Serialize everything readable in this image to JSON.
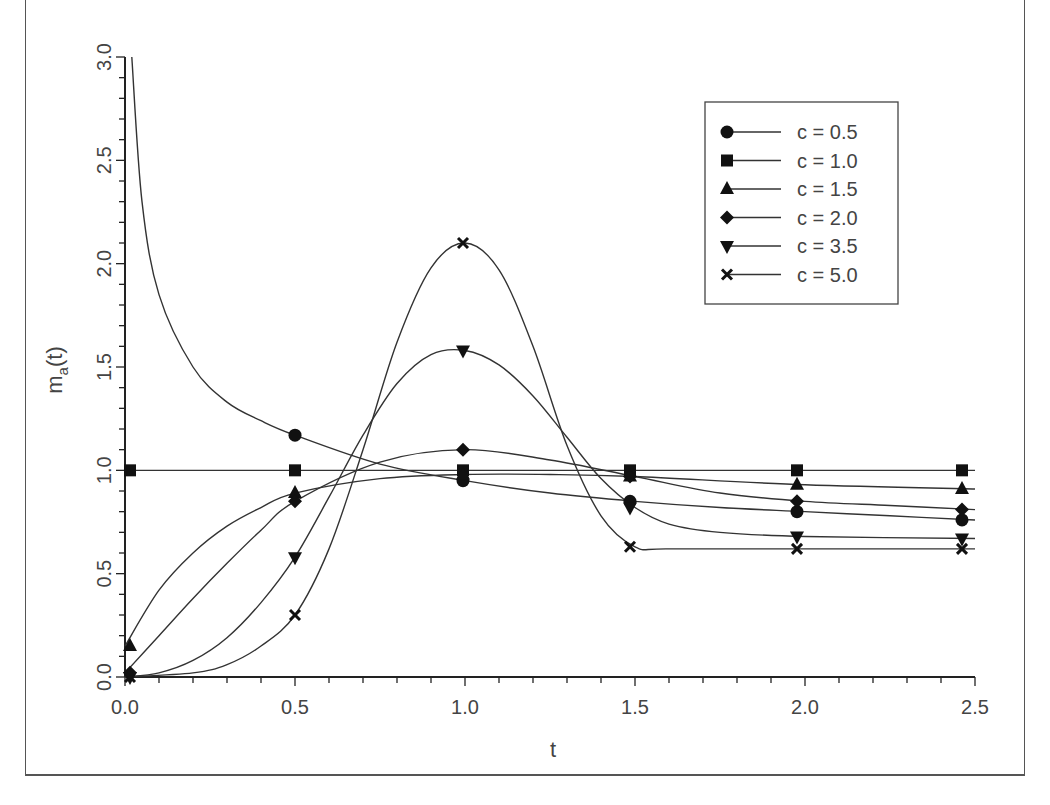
{
  "chart_data": {
    "type": "line",
    "title": "",
    "xlabel": "t",
    "ylabel": "m_a(t)",
    "ylabel_main": "m",
    "ylabel_sub": "a",
    "ylabel_tail": "(t)",
    "xlim": [
      0.0,
      2.5
    ],
    "ylim": [
      0.0,
      3.0
    ],
    "grid": false,
    "legend_position": "upper right",
    "x_ticks": [
      "0.0",
      "0.5",
      "1.0",
      "1.5",
      "2.0",
      "2.5"
    ],
    "y_ticks": [
      "0.0",
      "0.5",
      "1.0",
      "1.5",
      "2.0",
      "2.5",
      "3.0"
    ],
    "x": [
      0.0,
      0.5,
      1.0,
      1.5,
      2.0,
      2.5
    ],
    "series": [
      {
        "name": "c = 0.5",
        "marker": "circle",
        "values": [
          null,
          1.17,
          0.95,
          0.85,
          0.8,
          0.76
        ],
        "curve": [
          [
            0.02,
            3.0
          ],
          [
            0.05,
            2.3
          ],
          [
            0.1,
            1.85
          ],
          [
            0.2,
            1.5
          ],
          [
            0.3,
            1.33
          ],
          [
            0.4,
            1.24
          ],
          [
            0.5,
            1.17
          ],
          [
            0.75,
            1.03
          ],
          [
            1.0,
            0.95
          ],
          [
            1.25,
            0.89
          ],
          [
            1.5,
            0.85
          ],
          [
            1.75,
            0.82
          ],
          [
            2.0,
            0.8
          ],
          [
            2.25,
            0.78
          ],
          [
            2.5,
            0.76
          ]
        ]
      },
      {
        "name": "c = 1.0",
        "marker": "square",
        "values": [
          1.0,
          1.0,
          1.0,
          1.0,
          1.0,
          1.0
        ],
        "curve": [
          [
            0.0,
            1.0
          ],
          [
            2.5,
            1.0
          ]
        ]
      },
      {
        "name": "c = 1.5",
        "marker": "triangle-up",
        "values": [
          0.15,
          0.89,
          0.98,
          0.97,
          0.93,
          0.91
        ],
        "curve": [
          [
            0.0,
            0.15
          ],
          [
            0.1,
            0.42
          ],
          [
            0.2,
            0.6
          ],
          [
            0.3,
            0.73
          ],
          [
            0.4,
            0.82
          ],
          [
            0.5,
            0.89
          ],
          [
            0.75,
            0.96
          ],
          [
            1.0,
            0.98
          ],
          [
            1.25,
            0.98
          ],
          [
            1.5,
            0.97
          ],
          [
            2.0,
            0.93
          ],
          [
            2.5,
            0.91
          ]
        ]
      },
      {
        "name": "c = 2.0",
        "marker": "diamond",
        "values": [
          0.02,
          0.85,
          1.1,
          0.97,
          0.85,
          0.81
        ],
        "curve": [
          [
            0.0,
            0.02
          ],
          [
            0.1,
            0.2
          ],
          [
            0.2,
            0.38
          ],
          [
            0.3,
            0.55
          ],
          [
            0.4,
            0.71
          ],
          [
            0.5,
            0.85
          ],
          [
            0.75,
            1.04
          ],
          [
            1.0,
            1.1
          ],
          [
            1.25,
            1.05
          ],
          [
            1.5,
            0.97
          ],
          [
            1.75,
            0.89
          ],
          [
            2.0,
            0.85
          ],
          [
            2.25,
            0.83
          ],
          [
            2.5,
            0.81
          ]
        ]
      },
      {
        "name": "c = 3.5",
        "marker": "triangle-down",
        "values": [
          0.0,
          0.58,
          1.58,
          0.82,
          0.68,
          0.67
        ],
        "curve": [
          [
            0.0,
            0.0
          ],
          [
            0.1,
            0.02
          ],
          [
            0.2,
            0.08
          ],
          [
            0.3,
            0.19
          ],
          [
            0.4,
            0.36
          ],
          [
            0.5,
            0.58
          ],
          [
            0.6,
            0.87
          ],
          [
            0.7,
            1.17
          ],
          [
            0.8,
            1.42
          ],
          [
            0.9,
            1.56
          ],
          [
            1.0,
            1.58
          ],
          [
            1.1,
            1.51
          ],
          [
            1.2,
            1.36
          ],
          [
            1.3,
            1.16
          ],
          [
            1.4,
            0.96
          ],
          [
            1.5,
            0.82
          ],
          [
            1.6,
            0.74
          ],
          [
            1.75,
            0.7
          ],
          [
            2.0,
            0.68
          ],
          [
            2.5,
            0.67
          ]
        ]
      },
      {
        "name": "c = 5.0",
        "marker": "x",
        "values": [
          0.0,
          0.3,
          2.1,
          0.63,
          0.62,
          0.62
        ],
        "curve": [
          [
            0.0,
            0.0
          ],
          [
            0.2,
            0.02
          ],
          [
            0.3,
            0.06
          ],
          [
            0.4,
            0.15
          ],
          [
            0.5,
            0.3
          ],
          [
            0.6,
            0.62
          ],
          [
            0.7,
            1.1
          ],
          [
            0.8,
            1.62
          ],
          [
            0.9,
            1.98
          ],
          [
            1.0,
            2.1
          ],
          [
            1.1,
            1.97
          ],
          [
            1.2,
            1.6
          ],
          [
            1.3,
            1.12
          ],
          [
            1.4,
            0.78
          ],
          [
            1.5,
            0.63
          ],
          [
            1.6,
            0.62
          ],
          [
            2.0,
            0.62
          ],
          [
            2.5,
            0.62
          ]
        ]
      }
    ]
  },
  "legend": {
    "items": [
      {
        "label": "c  =  0.5",
        "marker": "circle"
      },
      {
        "label": "c  =  1.0",
        "marker": "square"
      },
      {
        "label": "c  =  1.5",
        "marker": "triangle-up"
      },
      {
        "label": "c  =  2.0",
        "marker": "diamond"
      },
      {
        "label": "c  =  3.5",
        "marker": "triangle-down"
      },
      {
        "label": "c  =  5.0",
        "marker": "x"
      }
    ]
  },
  "colors": {
    "line": "#333333",
    "marker": "#111111",
    "text": "#444444",
    "frame": "#555555"
  }
}
